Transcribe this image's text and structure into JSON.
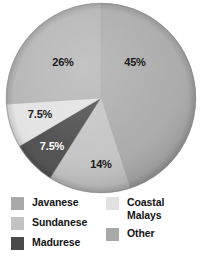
{
  "chart_data": {
    "type": "pie",
    "title": "",
    "subtitle": "",
    "xlabel": "",
    "ylabel": "",
    "legend_position": "bottom",
    "grid": false,
    "unit": "%",
    "categories": [
      "Javanese",
      "Coastal Malays",
      "Madurese",
      "Other",
      "Sundanese"
    ],
    "values": [
      45,
      14,
      7.5,
      7.5,
      26
    ],
    "labels": [
      "45%",
      "14%",
      "7.5%",
      "7.5%",
      "26%"
    ],
    "slices": [
      {
        "name": "Javanese",
        "value": 45,
        "label": "45%",
        "color": "#a9a9a9",
        "start_angle": 0,
        "end_angle": 162,
        "label_x": 135,
        "label_y": 62,
        "label_color": "dark"
      },
      {
        "name": "Coastal Malays",
        "value": 14,
        "label": "14%",
        "color": "#c3c3c3",
        "start_angle": 162,
        "end_angle": 212.4,
        "label_x": 101,
        "label_y": 164,
        "label_color": "dark"
      },
      {
        "name": "Madurese",
        "value": 7.5,
        "label": "7.5%",
        "color": "#4a4a4a",
        "start_angle": 212.4,
        "end_angle": 239.4,
        "label_x": 52,
        "label_y": 146,
        "label_color": "light"
      },
      {
        "name": "Other",
        "value": 7.5,
        "label": "7.5%",
        "color": "#e2e2e2",
        "start_angle": 239.4,
        "end_angle": 266.4,
        "label_x": 40,
        "label_y": 114,
        "label_color": "dark"
      },
      {
        "name": "Sundanese",
        "value": 26,
        "label": "26%",
        "color": "#b3b3b3",
        "start_angle": 266.4,
        "end_angle": 360,
        "label_x": 63,
        "label_y": 62,
        "label_color": "dark"
      }
    ],
    "geometry": {
      "center_x": 101,
      "center_y": 98,
      "radius": 95
    },
    "legend": {
      "columns": [
        {
          "name": "legend-column-left",
          "entries": [
            {
              "label": "Javanese",
              "color": "#a9a9a9"
            },
            {
              "label": "Sundanese",
              "color": "#c3c3c3"
            },
            {
              "label": "Madurese",
              "color": "#4a4a4a"
            }
          ]
        },
        {
          "name": "legend-column-right",
          "entries": [
            {
              "label": "Coastal",
              "label_line2": "Malays",
              "color": "#e2e2e2"
            },
            {
              "label": "Other",
              "color": "#a9a9a9"
            }
          ]
        }
      ]
    }
  }
}
